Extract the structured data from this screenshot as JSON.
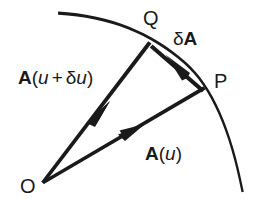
{
  "figure": {
    "name": "vector-derivative-diagram",
    "background_color": "#ffffff",
    "ink_color": "#1a1a1a"
  },
  "points": {
    "origin": {
      "label": "O",
      "x": 44,
      "y": 184
    },
    "p": {
      "label": "P",
      "x": 205,
      "y": 90
    },
    "q": {
      "label": "Q",
      "x": 150,
      "y": 43
    }
  },
  "labels": {
    "point_o": "O",
    "point_p": "P",
    "point_q": "Q",
    "vector_a_u": {
      "bold_a": "A",
      "open_paren": "(",
      "arg": "u",
      "close_paren": ")"
    },
    "vector_a_u_plus_du": {
      "bold_a": "A",
      "open_paren": "(",
      "arg1": "u",
      "plus": "+",
      "delta": "δ",
      "arg2": "u",
      "close_paren": ")"
    },
    "vector_delta_a": {
      "delta": "δ",
      "bold_a": "A"
    }
  },
  "curve": {
    "name": "trajectory-arc",
    "start": {
      "x": 58,
      "y": 13
    },
    "end": {
      "x": 243,
      "y": 192
    },
    "control1": {
      "x": 160,
      "y": 30
    },
    "control2": {
      "x": 232,
      "y": 100
    },
    "stroke_width_start": 3.2,
    "stroke_width_end": 1.6
  },
  "vectors": [
    {
      "name": "vector-a-u",
      "from": "origin",
      "to": "p",
      "from_x": 44,
      "from_y": 184,
      "to_x": 205,
      "to_y": 90,
      "arrowhead_x": 135,
      "arrowhead_y": 131,
      "label": "A(u)",
      "stroke_width": 5
    },
    {
      "name": "vector-a-u-plus-delta-u",
      "from": "origin",
      "to": "q",
      "from_x": 44,
      "from_y": 184,
      "to_x": 150,
      "to_y": 43,
      "arrowhead_x": 99,
      "arrowhead_y": 113,
      "label": "A(u + δu)",
      "stroke_width": 5
    },
    {
      "name": "vector-delta-a",
      "from": "p",
      "to": "q",
      "from_x": 204,
      "from_y": 89,
      "to_x": 152,
      "to_y": 44,
      "arrowhead_x": 177,
      "arrowhead_y": 65,
      "label": "δA",
      "stroke_width": 4
    }
  ]
}
